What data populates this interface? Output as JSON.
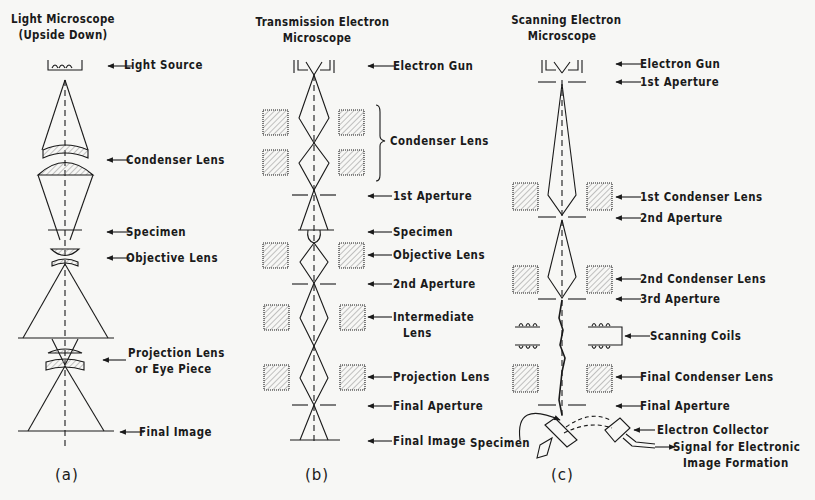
{
  "panels": [
    {
      "id": "a",
      "title": [
        "Light Microscope",
        "(Upside Down)"
      ],
      "caption": "(a)",
      "labels": [
        "Light Source",
        "Condenser Lens",
        "Specimen",
        "Objective Lens",
        "Projection Lens",
        "or Eye Piece",
        "Final Image"
      ]
    },
    {
      "id": "b",
      "title": [
        "Transmission Electron",
        "Microscope"
      ],
      "caption": "(b)",
      "labels": [
        "Electron Gun",
        "Condenser Lens",
        "1st Aperture",
        "Specimen",
        "Objective Lens",
        "2nd Aperture",
        "Intermediate",
        "Lens",
        "Projection Lens",
        "Final Aperture",
        "Final Image"
      ]
    },
    {
      "id": "c",
      "title": [
        "Scanning Electron",
        "Microscope"
      ],
      "caption": "(c)",
      "labels": [
        "Electron Gun",
        "1st Aperture",
        "1st Condenser Lens",
        "2nd Aperture",
        "2nd Condenser Lens",
        "3rd Aperture",
        "Scanning Coils",
        "Final Condenser Lens",
        "Final Aperture",
        "Electron Collector",
        "Signal for Electronic",
        "Image Formation",
        "Specimen"
      ]
    }
  ],
  "colors": {
    "ink": "#1a1a1a",
    "paper": "#f7f7f5",
    "hatch": "#9a9a9a"
  }
}
